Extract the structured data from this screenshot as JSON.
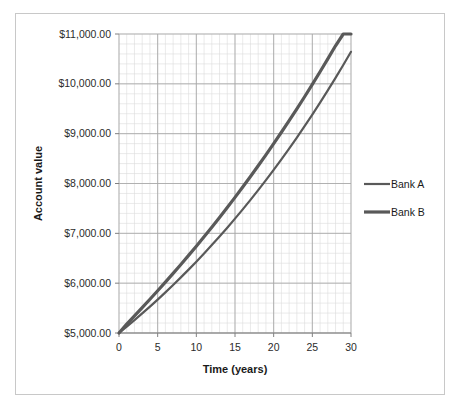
{
  "chart_data": {
    "type": "line",
    "title": "",
    "xlabel": "Time (years)",
    "ylabel": "Account value",
    "xlim": [
      0,
      30
    ],
    "ylim": [
      5000,
      11000
    ],
    "grid": true,
    "grid_minor": true,
    "legend_position": "right",
    "x": [
      0,
      1,
      2,
      3,
      4,
      5,
      6,
      7,
      8,
      9,
      10,
      11,
      12,
      13,
      14,
      15,
      16,
      17,
      18,
      19,
      20,
      21,
      22,
      23,
      24,
      25,
      26,
      27,
      28,
      29,
      30
    ],
    "series": [
      {
        "name": "Bank A",
        "color": "#595959",
        "values": [
          5000.0,
          5127.5,
          5258.26,
          5392.35,
          5529.86,
          5670.88,
          5815.5,
          5963.81,
          6115.9,
          6271.86,
          6431.81,
          6595.83,
          6764.03,
          6936.52,
          7113.41,
          7294.8,
          7480.82,
          7671.58,
          7867.2,
          8067.81,
          8273.54,
          8484.52,
          8700.88,
          8922.76,
          9150.3,
          9383.63,
          9622.92,
          9868.31,
          10119.96,
          10378.02,
          10642.67
        ]
      },
      {
        "name": "Bank B",
        "color": "#595959",
        "values": [
          5000.0,
          5180.0,
          5345.0,
          5510.0,
          5678.0,
          5848.0,
          6020.0,
          6196.0,
          6375.0,
          6557.0,
          6742.0,
          6931.0,
          7123.0,
          7319.0,
          7518.0,
          7722.0,
          7929.0,
          8140.0,
          8356.0,
          8575.0,
          8799.0,
          9028.0,
          9261.0,
          9499.0,
          9741.0,
          9989.0,
          10242.0,
          10500.0,
          10763.0,
          11032.0,
          11307.0
        ]
      }
    ],
    "y_ticks": [
      {
        "value": 5000,
        "label": "$5,000.00"
      },
      {
        "value": 6000,
        "label": "$6,000.00"
      },
      {
        "value": 7000,
        "label": "$7,000.00"
      },
      {
        "value": 8000,
        "label": "$8,000.00"
      },
      {
        "value": 9000,
        "label": "$9,000.00"
      },
      {
        "value": 10000,
        "label": "$10,000.00"
      },
      {
        "value": 11000,
        "label": "$11,000.00"
      }
    ],
    "x_ticks": [
      {
        "value": 0,
        "label": "0"
      },
      {
        "value": 5,
        "label": "5"
      },
      {
        "value": 10,
        "label": "10"
      },
      {
        "value": 15,
        "label": "15"
      },
      {
        "value": 20,
        "label": "20"
      },
      {
        "value": 25,
        "label": "25"
      },
      {
        "value": 30,
        "label": "30"
      }
    ],
    "legend_entries": [
      {
        "label": "Bank A",
        "color": "#595959",
        "width": 2.2
      },
      {
        "label": "Bank B",
        "color": "#595959",
        "width": 3.2
      }
    ],
    "colors": {
      "grid_major": "#a6a6a6",
      "grid_minor": "#dcdcdc",
      "axis": "#808080",
      "text": "#2b2b2b",
      "frame": "#c8c8c8",
      "background": "#ffffff"
    }
  }
}
